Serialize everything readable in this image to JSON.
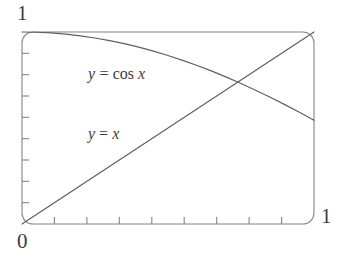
{
  "figure": {
    "background_color": "#ffffff",
    "line_color": "#5a5a5a",
    "frame_color": "#7a7a7a",
    "text_color": "#3b3b3b"
  },
  "labels": {
    "y_max": "1",
    "origin": "0",
    "x_max": "1"
  },
  "curve_labels": {
    "cos": {
      "lhs": "y",
      "eq": "=",
      "fn": "cos",
      "arg": "x",
      "full": "y = cos x"
    },
    "identity": {
      "lhs": "y",
      "eq": "=",
      "arg": "x",
      "full": "y = x"
    }
  },
  "chart_data": {
    "type": "line",
    "title": "",
    "xlabel": "",
    "ylabel": "",
    "xlim": [
      0,
      1
    ],
    "ylim": [
      0,
      1
    ],
    "grid": false,
    "legend": "inline-annotations",
    "xticks": [
      0,
      0.111,
      0.222,
      0.333,
      0.444,
      0.556,
      0.667,
      0.778,
      0.889,
      1
    ],
    "xticklabels": [
      "0",
      "",
      "",
      "",
      "",
      "",
      "",
      "",
      "",
      "1"
    ],
    "yticks": [
      0,
      0.111,
      0.222,
      0.333,
      0.444,
      0.556,
      0.667,
      0.778,
      0.889,
      1
    ],
    "yticklabels": [
      "0",
      "",
      "",
      "",
      "",
      "",
      "",
      "",
      "",
      "1"
    ],
    "annotations": [
      {
        "text": "y = cos x",
        "x": 0.23,
        "y": 0.77
      },
      {
        "text": "y = x",
        "x": 0.23,
        "y": 0.46
      }
    ],
    "intersection": {
      "x": 0.739,
      "y": 0.739,
      "label": ""
    },
    "series": [
      {
        "name": "y = cos x",
        "x": [
          0.0,
          0.05,
          0.1,
          0.15,
          0.2,
          0.25,
          0.3,
          0.35,
          0.4,
          0.45,
          0.5,
          0.55,
          0.6,
          0.65,
          0.7,
          0.75,
          0.8,
          0.85,
          0.9,
          0.95,
          1.0
        ],
        "values": [
          1.0,
          0.99875,
          0.995,
          0.98877,
          0.98007,
          0.96891,
          0.95534,
          0.93937,
          0.92106,
          0.90045,
          0.87758,
          0.85252,
          0.82534,
          0.79608,
          0.76484,
          0.73169,
          0.69671,
          0.65998,
          0.62161,
          0.58168,
          0.5403
        ]
      },
      {
        "name": "y = x",
        "x": [
          0.0,
          1.0
        ],
        "values": [
          0.0,
          1.0
        ]
      }
    ]
  }
}
